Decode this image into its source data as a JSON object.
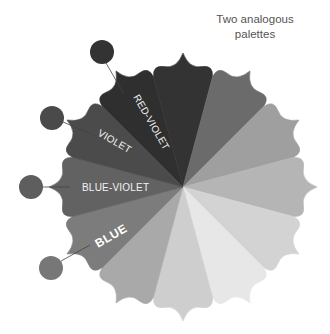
{
  "title": {
    "line1": "Two analogous",
    "line2": "palettes"
  },
  "wheel": {
    "center": [
      183,
      187
    ],
    "tip_radius": 134,
    "segments": [
      {
        "angle": 240,
        "color": "#2f2f2f",
        "label": "RED-VIOLET"
      },
      {
        "angle": 270,
        "color": "#333333",
        "label": ""
      },
      {
        "angle": 300,
        "color": "#6b6b6b",
        "label": ""
      },
      {
        "angle": 330,
        "color": "#9f9f9f",
        "label": ""
      },
      {
        "angle": 0,
        "color": "#b5b5b5",
        "label": ""
      },
      {
        "angle": 30,
        "color": "#d3d3d3",
        "label": ""
      },
      {
        "angle": 60,
        "color": "#e7e7e7",
        "label": ""
      },
      {
        "angle": 90,
        "color": "#cecece",
        "label": ""
      },
      {
        "angle": 120,
        "color": "#a9a9a9",
        "label": ""
      },
      {
        "angle": 150,
        "color": "#7c7c7c",
        "label": "BLUE"
      },
      {
        "angle": 180,
        "color": "#626262",
        "label": "BLUE-VIOLET"
      },
      {
        "angle": 210,
        "color": "#4b4b4b",
        "label": "VIOLET"
      }
    ]
  },
  "labels": {
    "red_violet": "RED-VIOLET",
    "violet": "VIOLET",
    "blue_violet": "BLUE-VIOLET",
    "blue": "BLUE"
  },
  "swatches": [
    {
      "name": "red-violet",
      "cx": 102,
      "cy": 52,
      "color": "#333333"
    },
    {
      "name": "violet",
      "cx": 52,
      "cy": 118,
      "color": "#4a4a4a"
    },
    {
      "name": "blue-violet",
      "cx": 31,
      "cy": 187,
      "color": "#5e5e5e"
    },
    {
      "name": "blue",
      "cx": 51,
      "cy": 268,
      "color": "#777777"
    }
  ]
}
